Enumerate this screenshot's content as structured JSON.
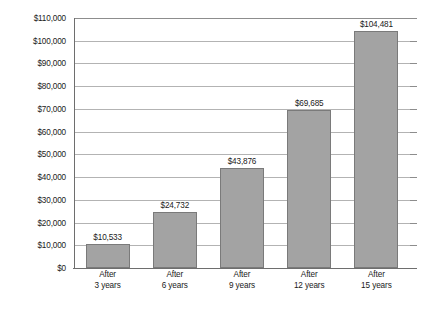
{
  "chart_data": {
    "type": "bar",
    "title": "",
    "subtitle": "",
    "xlabel": "",
    "ylabel": "",
    "categories": [
      "After 3 years",
      "After 6 years",
      "After 9 years",
      "After 12 years",
      "After 15 years"
    ],
    "category_lines": [
      [
        "After",
        "3 years"
      ],
      [
        "After",
        "6 years"
      ],
      [
        "After",
        "9 years"
      ],
      [
        "After",
        "12 years"
      ],
      [
        "After",
        "15 years"
      ]
    ],
    "values": [
      10533,
      24732,
      43876,
      69685,
      104481
    ],
    "value_labels": [
      "$10,533",
      "$24,732",
      "$43,876",
      "$69,685",
      "$104,481"
    ],
    "ylim": [
      0,
      110000
    ],
    "ytick_step": 10000,
    "ytick_labels": [
      "$110,000",
      "$100,000",
      "$90,000",
      "$80,000",
      "$70,000",
      "$60,000",
      "$50,000",
      "$40,000",
      "$30,000",
      "$20,000",
      "$10,000",
      "$0"
    ],
    "ytick_values": [
      110000,
      100000,
      90000,
      80000,
      70000,
      60000,
      50000,
      40000,
      30000,
      20000,
      10000,
      0
    ],
    "grid": true,
    "grid_axis": "y",
    "legend": false,
    "legend_position": "none",
    "bar_color": "#a3a3a3",
    "bar_border_color": "#7a7a7a",
    "gridline_color": "#b3b3b3",
    "axis_color": "#6e6e6e",
    "text_color": "#1a1a1a",
    "background_color": "#ffffff"
  }
}
